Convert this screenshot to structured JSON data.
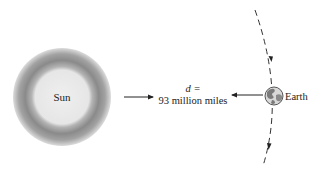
{
  "diagram": {
    "sun": {
      "label": "Sun",
      "cx": 62,
      "cy": 97,
      "outer_r": 49,
      "inner_r": 30
    },
    "earth": {
      "label": "Earth",
      "cx": 274,
      "cy": 96,
      "r": 9
    },
    "distance": {
      "line1": "d =",
      "line2": "93 million miles"
    },
    "colors": {
      "sun_core": "#e8e8e8",
      "sun_halo": "#8a8a8a",
      "line": "#222222",
      "earth_fill": "#d6d6d6",
      "earth_land": "#7a7a7a"
    }
  }
}
